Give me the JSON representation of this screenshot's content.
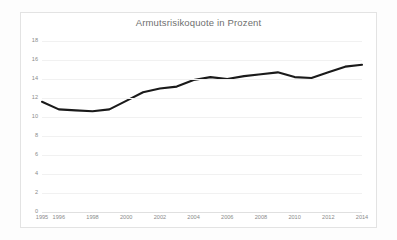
{
  "chart_data": {
    "type": "line",
    "title": "Armutsrisikoquote in Prozent",
    "xlabel": "",
    "ylabel": "",
    "x": [
      1995,
      1996,
      1997,
      1998,
      1999,
      2000,
      2001,
      2002,
      2003,
      2004,
      2005,
      2006,
      2007,
      2008,
      2009,
      2010,
      2011,
      2012,
      2013,
      2014
    ],
    "values": [
      11.6,
      10.8,
      10.7,
      10.6,
      10.8,
      11.7,
      12.6,
      13.0,
      13.2,
      13.9,
      14.2,
      14.0,
      14.3,
      14.5,
      14.7,
      14.2,
      14.1,
      14.7,
      15.3,
      15.5
    ],
    "series": [
      {
        "name": "Armutsrisikoquote",
        "color": "#1a1a1a",
        "values": [
          11.6,
          10.8,
          10.7,
          10.6,
          10.8,
          11.7,
          12.6,
          13.0,
          13.2,
          13.9,
          14.2,
          14.0,
          14.3,
          14.5,
          14.7,
          14.2,
          14.1,
          14.7,
          15.3,
          15.5
        ]
      }
    ],
    "xlim": [
      1995,
      2014
    ],
    "ylim": [
      0,
      18
    ],
    "ytick_labels": [
      "18",
      "16",
      "14",
      "12",
      "10",
      "8",
      "6",
      "4",
      "2",
      "0"
    ],
    "ytick_values": [
      18,
      16,
      14,
      12,
      10,
      8,
      6,
      4,
      2,
      0
    ],
    "xtick_labels": [
      "1995",
      "1996",
      "1998",
      "2000",
      "2002",
      "2004",
      "2006",
      "2008",
      "2010",
      "2012",
      "2014"
    ],
    "xtick_values": [
      1995,
      1996,
      1998,
      2000,
      2002,
      2004,
      2006,
      2008,
      2010,
      2012,
      2014
    ],
    "grid": "horizontal",
    "legend": "none",
    "line_width": 2.1,
    "colors": {
      "line": "#1a1a1a",
      "grid": "#f1f1f1",
      "axis": "#e0e0e0",
      "tick_text": "#8a8a8a",
      "title_text": "#6f6f6f",
      "border": "#e3e3e3",
      "plot_background": "#ffffff"
    }
  }
}
